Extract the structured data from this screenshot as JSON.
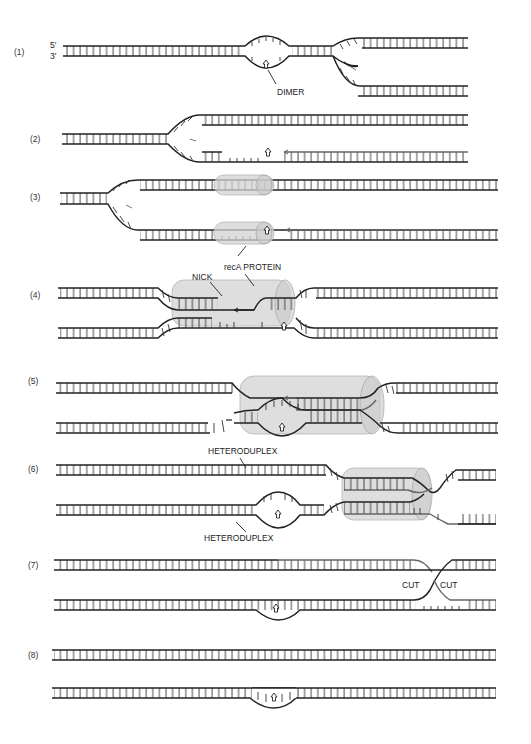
{
  "figure": {
    "end_labels": {
      "five_prime": "5′",
      "three_prime": "3′"
    },
    "steps": [
      {
        "id": "1",
        "label": "(1)",
        "annotations": [
          "DIMER"
        ]
      },
      {
        "id": "2",
        "label": "(2)",
        "annotations": []
      },
      {
        "id": "3",
        "label": "(3)",
        "annotations": [
          "recA PROTEIN"
        ]
      },
      {
        "id": "4",
        "label": "(4)",
        "annotations": [
          "NICK"
        ]
      },
      {
        "id": "5",
        "label": "(5)",
        "annotations": []
      },
      {
        "id": "6",
        "label": "(6)",
        "annotations": [
          "HETERODUPLEX",
          "HETERODUPLEX"
        ]
      },
      {
        "id": "7",
        "label": "(7)",
        "annotations": [
          "CUT",
          "CUT"
        ]
      },
      {
        "id": "8",
        "label": "(8)",
        "annotations": []
      }
    ],
    "labels": {
      "dimer": "DIMER",
      "reca": "recA PROTEIN",
      "nick": "NICK",
      "heteroduplex_top": "HETERODUPLEX",
      "heteroduplex_bottom": "HETERODUPLEX",
      "cut_left": "CUT",
      "cut_right": "CUT"
    },
    "colors": {
      "backbone": "#222222",
      "new_strand": "#666666",
      "recA_protein": "#d3d3d3",
      "background": "#ffffff"
    }
  }
}
